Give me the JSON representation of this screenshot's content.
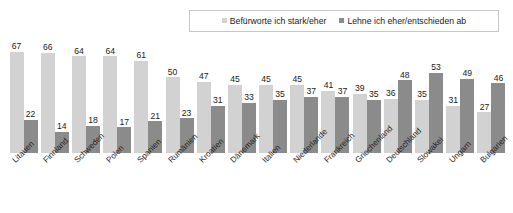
{
  "legend": {
    "items": [
      {
        "label": "Befürworte ich stark/eher",
        "color": "#d2d2d2",
        "icon": "square-swatch-icon"
      },
      {
        "label": "Lehne ich eher/entschieden ab",
        "color": "#8b8b8b",
        "icon": "square-swatch-icon"
      }
    ]
  },
  "colors": {
    "support": "#d2d2d2",
    "oppose": "#8b8b8b",
    "text": "#1a1a1a",
    "legend_border": "#c8c8c8",
    "background": "#ffffff"
  },
  "chart_data": {
    "type": "bar",
    "title": "",
    "subtitle": "",
    "xlabel": "",
    "ylabel": "",
    "ylim": [
      0,
      70
    ],
    "grid": false,
    "legend_position": "top-right",
    "orientation": "vertical",
    "grouping": "grouped",
    "value_labels": true,
    "categories": [
      "Litauen",
      "Finnland",
      "Schweden",
      "Polen",
      "Spanien",
      "Rumänien",
      "Kroatien",
      "Dänemark",
      "Italien",
      "Niederlande",
      "Frankreich",
      "Griechenland",
      "Deutschland",
      "Slowakei",
      "Ungarn",
      "Bulgarien"
    ],
    "series": [
      {
        "name": "Befürworte ich stark/eher",
        "color": "#d2d2d2",
        "values": [
          67,
          66,
          64,
          64,
          61,
          50,
          47,
          45,
          45,
          45,
          41,
          39,
          36,
          35,
          31,
          27
        ]
      },
      {
        "name": "Lehne ich eher/entschieden ab",
        "color": "#8b8b8b",
        "values": [
          22,
          14,
          18,
          17,
          21,
          23,
          31,
          33,
          35,
          37,
          37,
          35,
          48,
          53,
          49,
          46
        ]
      }
    ]
  }
}
